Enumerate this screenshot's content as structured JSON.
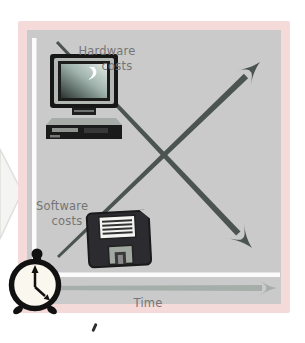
{
  "figure": {
    "labels": {
      "hardware_line1": "Hardware",
      "hardware_line2": "costs",
      "software_line1": "Software",
      "software_line2": "costs",
      "time": "Time"
    },
    "trends": [
      {
        "name": "Hardware costs",
        "direction": "decreasing over time",
        "arrow": "top-left to bottom-right"
      },
      {
        "name": "Software costs",
        "direction": "increasing over time",
        "arrow": "bottom-left to top-right"
      }
    ],
    "icons": {
      "computer": "computer-icon",
      "floppy": "floppy-disk-icon",
      "clock": "alarm-clock-icon"
    },
    "colors": {
      "panel_background": "#cacaca",
      "panel_border": "#f5dada",
      "trend_arrow": "#4c5452",
      "time_arrow": "#a6aeaa",
      "axis": "#fbfbfb",
      "label_text": "#757575"
    }
  }
}
